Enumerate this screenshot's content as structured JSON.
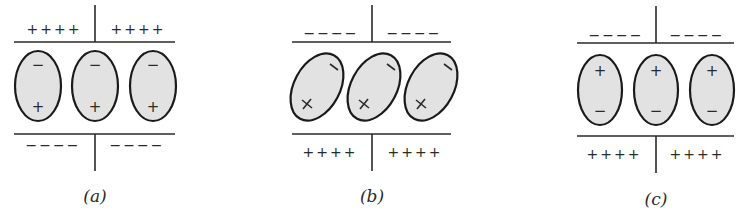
{
  "figure": {
    "panels": [
      {
        "id": "a",
        "caption": "(a)",
        "top_plate_charges": {
          "left": "++++",
          "right": "++++"
        },
        "bottom_plate_charges": {
          "left": "−−−−",
          "right": "−−−−"
        },
        "cells": [
          {
            "top": "−",
            "bottom": "+"
          },
          {
            "top": "−",
            "bottom": "+"
          },
          {
            "top": "−",
            "bottom": "+"
          }
        ],
        "cell_tilt": "vertical"
      },
      {
        "id": "b",
        "caption": "(b)",
        "top_plate_charges": {
          "left": "−−−−",
          "right": "−−−−"
        },
        "bottom_plate_charges": {
          "left": "++++",
          "right": "++++"
        },
        "cells": [
          {
            "top": "−",
            "bottom": "+"
          },
          {
            "top": "−",
            "bottom": "+"
          },
          {
            "top": "−",
            "bottom": "+"
          }
        ],
        "cell_tilt": "tilted"
      },
      {
        "id": "c",
        "caption": "(c)",
        "top_plate_charges": {
          "left": "−−−−",
          "right": "−−−−"
        },
        "bottom_plate_charges": {
          "left": "++++",
          "right": "++++"
        },
        "cells": [
          {
            "top": "+",
            "bottom": "−"
          },
          {
            "top": "+",
            "bottom": "−"
          },
          {
            "top": "+",
            "bottom": "−"
          }
        ],
        "cell_tilt": "vertical"
      }
    ],
    "colors": {
      "cell_fill": "#e2e2e2",
      "stroke": "#1a1a1a",
      "background": "#ffffff"
    }
  }
}
